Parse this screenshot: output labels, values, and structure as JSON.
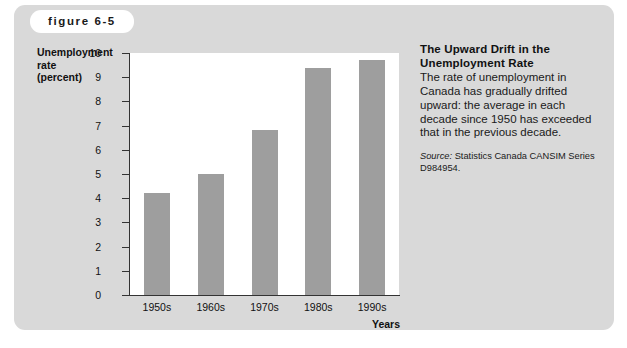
{
  "figure": {
    "tab_label": "figure 6-5"
  },
  "caption": {
    "title_line1": "The Upward Drift in the",
    "title_line2": "Unemployment Rate",
    "body": "The rate of unemployment in Canada has gradually drifted upward: the average in each decade since 1950 has exceeded that in the previous decade.",
    "source_word": "Source:",
    "source_text": " Statistics Canada CANSIM Series D984954."
  },
  "axis": {
    "y_title_line1": "Unemployment",
    "y_title_line2": "rate",
    "y_title_line3": "(percent)",
    "x_title": "Years"
  },
  "colors": {
    "panel_background": "#d9d9d9",
    "plot_background": "#ffffff",
    "bar_fill": "#9e9e9e",
    "axis_line": "#333333",
    "text": "#111111"
  },
  "chart_data": {
    "type": "bar",
    "title": "The Upward Drift in the Unemployment Rate",
    "categories": [
      "1950s",
      "1960s",
      "1970s",
      "1980s",
      "1990s"
    ],
    "values": [
      4.2,
      5.0,
      6.8,
      9.4,
      9.7
    ],
    "xlabel": "Years",
    "ylabel": "Unemployment rate (percent)",
    "ylim": [
      0,
      10
    ],
    "ytick_labels": [
      "0",
      "1",
      "2",
      "3",
      "4",
      "5",
      "6",
      "7",
      "8",
      "9",
      "10"
    ],
    "ytick_values": [
      0,
      1,
      2,
      3,
      4,
      5,
      6,
      7,
      8,
      9,
      10
    ],
    "grid": false,
    "legend": false,
    "source": "Statistics Canada CANSIM Series D984954."
  }
}
